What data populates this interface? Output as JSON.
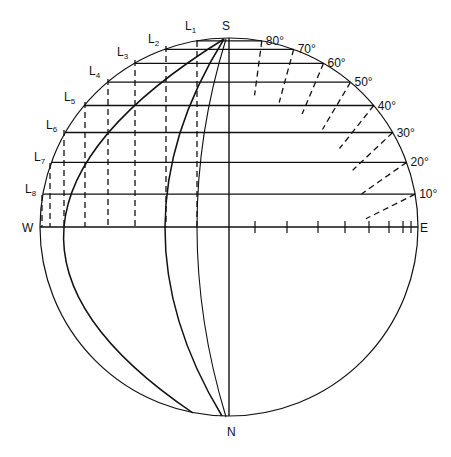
{
  "diagram": {
    "title": "",
    "poles": {
      "top": "S",
      "bottom": "N"
    },
    "directions": {
      "left": "W",
      "right": "E"
    },
    "latitude_labels": [
      "10°",
      "20°",
      "30°",
      "40°",
      "50°",
      "60°",
      "70°",
      "80°"
    ],
    "latitudes_deg": [
      10,
      20,
      30,
      40,
      50,
      60,
      70,
      80
    ],
    "l_labels": [
      {
        "main": "L",
        "sub": "1"
      },
      {
        "main": "L",
        "sub": "2"
      },
      {
        "main": "L",
        "sub": "3"
      },
      {
        "main": "L",
        "sub": "4"
      },
      {
        "main": "L",
        "sub": "5"
      },
      {
        "main": "L",
        "sub": "6"
      },
      {
        "main": "L",
        "sub": "7"
      },
      {
        "main": "L",
        "sub": "8"
      }
    ],
    "colors": {
      "ink": "#111111",
      "background": "#ffffff"
    }
  }
}
